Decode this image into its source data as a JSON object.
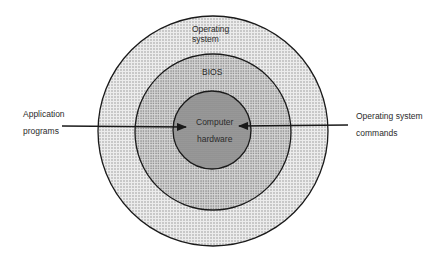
{
  "diagram": {
    "type": "concentric-layers",
    "layers": [
      {
        "id": "outer",
        "label_line1": "Operating",
        "label_line2": "system",
        "fill": "#e2e2e2"
      },
      {
        "id": "middle",
        "label": "BIOS",
        "fill": "#cfcfcf"
      },
      {
        "id": "inner",
        "label_line1": "Computer",
        "label_line2": "hardware",
        "fill": "#9a9a9a"
      }
    ],
    "inputs": [
      {
        "id": "left",
        "label_line1": "Application",
        "label_line2": "programs",
        "direction": "left-to-center"
      },
      {
        "id": "right",
        "label_line1": "Operating system",
        "label_line2": "commands",
        "direction": "right-to-center"
      }
    ],
    "colors": {
      "stroke": "#1a1a1a",
      "dots": "#6d6d6d"
    }
  }
}
